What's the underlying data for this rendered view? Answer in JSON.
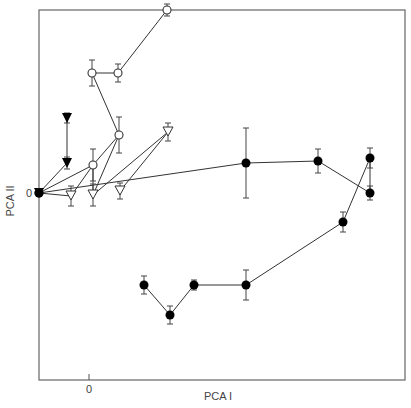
{
  "chart_data": {
    "type": "scatter",
    "title": "",
    "xlabel": "PCA I",
    "ylabel": "PCA II",
    "x_ticks": [
      {
        "value": 0,
        "label": "0"
      }
    ],
    "y_ticks": [
      {
        "value": 0,
        "label": "0"
      }
    ],
    "xlim": [
      -5.0,
      31.7
    ],
    "ylim": [
      -18.7,
      18.3
    ],
    "grid": false,
    "legend": null,
    "plot_box_px": {
      "left": 39,
      "top": 10,
      "right": 405,
      "bottom": 380
    },
    "px_mapping": {
      "x0_px": 89,
      "y0_px": 193,
      "px_per_unit": 10
    },
    "series": [
      {
        "name": "filled-triangles",
        "marker": "triangle-down-filled",
        "points": [
          {
            "x": -5.0,
            "y": 0.0,
            "err": 0
          },
          {
            "x": -2.2,
            "y": 3.0,
            "err": 0.6
          },
          {
            "x": -2.2,
            "y": 7.5,
            "err": 0.5
          }
        ],
        "path": [
          0,
          1,
          2
        ]
      },
      {
        "name": "open-circles",
        "marker": "circle-open",
        "points": [
          {
            "x": -5.0,
            "y": 0.0,
            "err": 0
          },
          {
            "x": 0.4,
            "y": 2.8,
            "err": 1.6
          },
          {
            "x": 3.0,
            "y": 5.8,
            "err": 1.8
          },
          {
            "x": 0.3,
            "y": 12.0,
            "err": 1.3
          },
          {
            "x": 2.9,
            "y": 12.0,
            "err": 0.9
          },
          {
            "x": 7.8,
            "y": 18.3,
            "err": 0.6
          }
        ],
        "path": [
          0,
          1,
          2,
          3,
          4,
          5
        ]
      },
      {
        "name": "open-triangles",
        "marker": "triangle-down-open",
        "points": [
          {
            "x": -1.8,
            "y": -0.3,
            "err": 1.0
          },
          {
            "x": 0.4,
            "y": -0.2,
            "err": 1.1
          },
          {
            "x": 3.1,
            "y": 0.2,
            "err": 0.8
          },
          {
            "x": 7.9,
            "y": 6.1,
            "err": 0.9
          }
        ],
        "segments": [
          [
            [
              -5.0,
              0.0
            ],
            [
              -1.8,
              -0.3
            ]
          ],
          [
            [
              0.4,
              2.8
            ],
            [
              -1.8,
              -0.3
            ]
          ],
          [
            [
              3.0,
              5.8
            ],
            [
              0.4,
              -0.2
            ]
          ],
          [
            [
              0.4,
              2.8
            ],
            [
              0.4,
              -0.2
            ]
          ],
          [
            [
              7.9,
              6.1
            ],
            [
              0.4,
              -0.2
            ]
          ],
          [
            [
              7.9,
              6.1
            ],
            [
              3.1,
              0.2
            ]
          ]
        ]
      },
      {
        "name": "filled-circles",
        "marker": "circle-filled",
        "points": [
          {
            "x": -5.0,
            "y": 0.0,
            "err": 0
          },
          {
            "x": 15.7,
            "y": 3.0,
            "err": 3.5
          },
          {
            "x": 22.9,
            "y": 3.2,
            "err": 1.2
          },
          {
            "x": 28.1,
            "y": 0.0,
            "err": 0.7
          },
          {
            "x": 28.1,
            "y": 3.5,
            "err": 1.0
          },
          {
            "x": 25.4,
            "y": -2.9,
            "err": 1.0
          },
          {
            "x": 15.7,
            "y": -9.2,
            "err": 1.5
          },
          {
            "x": 10.5,
            "y": -9.2,
            "err": 0.5
          },
          {
            "x": 8.1,
            "y": -12.2,
            "err": 0.9
          },
          {
            "x": 5.5,
            "y": -9.2,
            "err": 0.9
          }
        ],
        "path": [
          0,
          1,
          2,
          3,
          4,
          5,
          6,
          7,
          8,
          9
        ]
      }
    ]
  },
  "axes": {
    "x_label": "PCA I",
    "y_label": "PCA II",
    "x_zero_label": "0",
    "y_zero_label": "0"
  }
}
